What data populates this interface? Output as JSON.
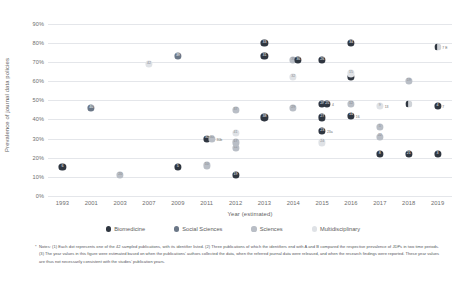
{
  "chart_data": {
    "type": "scatter",
    "title": "",
    "xlabel": "Year (estimated)",
    "ylabel": "Prevalence of journal data policies",
    "grid": true,
    "legend_position": "bottom",
    "ylim": [
      0,
      95
    ],
    "yticks": [
      "0%",
      "10%",
      "20%",
      "30%",
      "40%",
      "50%",
      "60%",
      "70%",
      "80%",
      "90%"
    ],
    "categories": [
      "1993",
      "2001",
      "2003",
      "2007",
      "2009",
      "2011",
      "2012",
      "2013",
      "2014",
      "2015",
      "2016",
      "2017",
      "2018",
      "2019"
    ],
    "series": [
      {
        "name": "Biomedicine",
        "color": "#2f3640"
      },
      {
        "name": "Social Sciences",
        "color": "#6b7787"
      },
      {
        "name": "Sciences",
        "color": "#b9bec6"
      },
      {
        "name": "Multidisciplinary",
        "color": "#dfe2e6"
      }
    ],
    "points": [
      {
        "id": "6",
        "year": "1993",
        "value": 15,
        "series": "Biomedicine"
      },
      {
        "id": "40",
        "year": "2001",
        "value": 46,
        "series": "Social Sciences"
      },
      {
        "id": "20",
        "year": "2003",
        "value": 11,
        "series": "Sciences"
      },
      {
        "id": "42",
        "year": "2007",
        "value": 69,
        "series": "Multidisciplinary"
      },
      {
        "id": "5",
        "year": "2009",
        "value": 15,
        "series": "Biomedicine"
      },
      {
        "id": "39",
        "year": "2009",
        "value": 73,
        "series": "Social Sciences"
      },
      {
        "id": "10",
        "year": "2011",
        "value": 16,
        "series": "Sciences"
      },
      {
        "id": "30",
        "year": "2011",
        "value": 30,
        "series": "Biomedicine"
      },
      {
        "id": "30b",
        "year": "2011",
        "value": 30,
        "series": "Sciences",
        "note": "30b"
      },
      {
        "id": "11",
        "year": "2012",
        "value": 25,
        "series": "Sciences"
      },
      {
        "id": "17",
        "year": "2012",
        "value": 28,
        "series": "Sciences"
      },
      {
        "id": "41",
        "year": "2012",
        "value": 33,
        "series": "Multidisciplinary"
      },
      {
        "id": "37",
        "year": "2012",
        "value": 45,
        "series": "Sciences"
      },
      {
        "id": "19",
        "year": "2012",
        "value": 11,
        "series": "Biomedicine"
      },
      {
        "id": "38",
        "year": "2013",
        "value": 41,
        "series": "Biomedicine"
      },
      {
        "id": "31",
        "year": "2013",
        "value": 73,
        "series": "Biomedicine"
      },
      {
        "id": "33",
        "year": "2013",
        "value": 80,
        "series": "Biomedicine"
      },
      {
        "id": "29",
        "year": "2014",
        "value": 46,
        "series": "Sciences"
      },
      {
        "id": "32",
        "year": "2014",
        "value": 62,
        "series": "Multidisciplinary"
      },
      {
        "id": "35",
        "year": "2014",
        "value": 71,
        "series": "Sciences"
      },
      {
        "id": "36",
        "year": "2014",
        "value": 71,
        "series": "Biomedicine"
      },
      {
        "id": "27",
        "year": "2015",
        "value": 41,
        "series": "Biomedicine"
      },
      {
        "id": "28",
        "year": "2015",
        "value": 48,
        "series": "Biomedicine"
      },
      {
        "id": "26",
        "year": "2015",
        "value": 71,
        "series": "Biomedicine"
      },
      {
        "id": "23",
        "year": "2015",
        "value": 34,
        "series": "Biomedicine",
        "note": "23a"
      },
      {
        "id": "25",
        "year": "2015",
        "value": 48,
        "series": "Biomedicine",
        "note": "4"
      },
      {
        "id": "24",
        "year": "2015",
        "value": 28,
        "series": "Multidisciplinary"
      },
      {
        "id": "14",
        "year": "2016",
        "value": 42,
        "series": "Biomedicine",
        "note": "16"
      },
      {
        "id": "12",
        "year": "2016",
        "value": 48,
        "series": "Sciences"
      },
      {
        "id": "13",
        "year": "2016",
        "value": 62,
        "series": "Biomedicine"
      },
      {
        "id": "34",
        "year": "2016",
        "value": 80,
        "series": "Biomedicine"
      },
      {
        "id": "15",
        "year": "2016",
        "value": 64,
        "series": "Multidisciplinary"
      },
      {
        "id": "9",
        "year": "2017",
        "value": 47,
        "series": "Multidisciplinary",
        "note": "13"
      },
      {
        "id": "5b",
        "year": "2017",
        "value": 36,
        "series": "Sciences"
      },
      {
        "id": "22",
        "year": "2017",
        "value": 31,
        "series": "Sciences"
      },
      {
        "id": "8",
        "year": "2017",
        "value": 22,
        "series": "Biomedicine"
      },
      {
        "id": "18",
        "year": "2018",
        "value": 48,
        "series": "Biomedicine",
        "half": true
      },
      {
        "id": "19b",
        "year": "2018",
        "value": 60,
        "series": "Sciences"
      },
      {
        "id": "21",
        "year": "2018",
        "value": 22,
        "series": "Biomedicine"
      },
      {
        "id": "7",
        "year": "2019",
        "value": 78,
        "series": "Biomedicine",
        "half": true,
        "note": "7 E"
      },
      {
        "id": "4",
        "year": "2019",
        "value": 47,
        "series": "Biomedicine",
        "note": "7"
      },
      {
        "id": "3",
        "year": "2019",
        "value": 22,
        "series": "Biomedicine"
      }
    ]
  },
  "footnote": {
    "marker": "*",
    "text": "Notes: (1) Each dot represents one of the 42 sampled publications, with its identifier listed. (2) Three publications of which the identifiers end with A and B compared the respective prevalence of JDPs in two time periods. (3) The year values in this figure were estimated based on when the publications' authors collected the data, when the referred journal data were released, and when the research findings were reported. These year values are thus not necessarily consistent with the studies' publication years."
  }
}
